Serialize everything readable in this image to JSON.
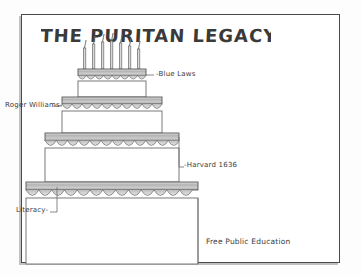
{
  "title": "THE   PURITAN  LEGACY",
  "title_words": [
    "THE",
    "PURITAN",
    "LEGACY"
  ],
  "medium": "pencil sketch on white paper",
  "candles": {
    "count": 7
  },
  "tiers": [
    {
      "index": 1,
      "name": "top-tier",
      "label": "Blue Laws"
    },
    {
      "index": 2,
      "name": "second-tier",
      "label": "Roger Williams"
    },
    {
      "index": 3,
      "name": "third-tier",
      "label": "Harvard 1636"
    },
    {
      "index": 4,
      "name": "bottom-tier",
      "label": "Free Public Education"
    }
  ],
  "labels": [
    {
      "id": "blue-laws",
      "text": "Blue Laws",
      "lead": "-"
    },
    {
      "id": "roger-williams",
      "text": "Roger Williams",
      "lead": "-"
    },
    {
      "id": "harvard-1636",
      "text": "Harvard 1636",
      "lead": "-"
    },
    {
      "id": "literacy",
      "text": "Literacy",
      "lead": "-"
    },
    {
      "id": "free-public-education",
      "text": "Free Public Education",
      "lead": ""
    }
  ],
  "colors": {
    "paper": "#ffffff",
    "ink": "#3a3a3a",
    "frame_border": "#4a4a4a",
    "graphite": "#8a8a8a",
    "frosting_shade": "#b9b9b9"
  }
}
